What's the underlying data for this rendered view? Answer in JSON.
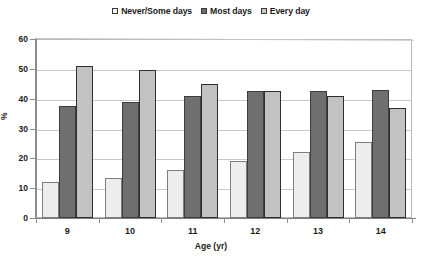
{
  "chart_data": {
    "type": "bar",
    "title": "",
    "xlabel": "Age (yr)",
    "ylabel": "%",
    "categories": [
      "9",
      "10",
      "11",
      "12",
      "13",
      "14"
    ],
    "series": [
      {
        "name": "Never/Some days",
        "values": [
          12,
          13.5,
          16,
          19,
          22,
          25.5
        ],
        "color": "#ededed"
      },
      {
        "name": "Most days",
        "values": [
          37.5,
          39,
          41,
          42.5,
          42.5,
          43
        ],
        "color": "#6f6f6f"
      },
      {
        "name": "Every day",
        "values": [
          51,
          49.5,
          45,
          42.5,
          41,
          37
        ],
        "color": "#c2c2c2"
      }
    ],
    "ylim": [
      0,
      60
    ],
    "yticks": [
      0,
      10,
      20,
      30,
      40,
      50,
      60
    ],
    "ytick_labels": [
      "0",
      "10",
      "20",
      "30",
      "40",
      "50",
      "60"
    ],
    "grid": true,
    "legend_position": "top-center"
  },
  "legend": {
    "items": [
      {
        "label": "Never/Some days"
      },
      {
        "label": "Most days"
      },
      {
        "label": "Every day"
      }
    ]
  },
  "axes": {
    "y_title": "%",
    "x_title": "Age (yr)"
  }
}
